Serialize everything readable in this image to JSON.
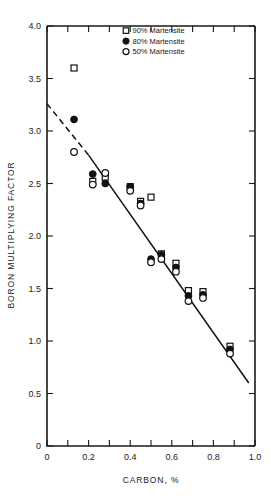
{
  "chart_data": {
    "type": "scatter",
    "title": "",
    "xlabel": "CARBON, %",
    "ylabel": "BORON MULTIPLYING FACTOR",
    "xlim": [
      0,
      1.0
    ],
    "ylim": [
      0,
      4.0
    ],
    "xticks": [
      0,
      0.1,
      0.2,
      0.3,
      0.4,
      0.5,
      0.6,
      0.7,
      0.8,
      0.9,
      1.0
    ],
    "xticklabels": [
      "0",
      "0.2",
      "0.4",
      "0.6",
      "0.8",
      "1.0"
    ],
    "xticklabel_values": [
      0,
      0.2,
      0.4,
      0.6,
      0.8,
      1.0
    ],
    "yticks": [
      0,
      0.5,
      1.0,
      1.5,
      2.0,
      2.5,
      3.0,
      3.5,
      4.0
    ],
    "yticklabels": [
      "0",
      "0.5",
      "1.0",
      "1.5",
      "2.0",
      "2.5",
      "3.0",
      "3.5",
      "4.0"
    ],
    "grid": false,
    "legend_position": "top-center",
    "series": [
      {
        "name": "90% Martensite",
        "marker": "open-square",
        "points": [
          [
            0.13,
            3.6
          ],
          [
            0.22,
            2.52
          ],
          [
            0.28,
            2.56
          ],
          [
            0.4,
            2.47
          ],
          [
            0.45,
            2.33
          ],
          [
            0.5,
            2.37
          ],
          [
            0.55,
            1.83
          ],
          [
            0.62,
            1.74
          ],
          [
            0.68,
            1.48
          ],
          [
            0.75,
            1.47
          ],
          [
            0.88,
            0.95
          ]
        ]
      },
      {
        "name": "80% Martensite",
        "marker": "filled-circle",
        "points": [
          [
            0.13,
            3.11
          ],
          [
            0.22,
            2.59
          ],
          [
            0.28,
            2.5
          ],
          [
            0.4,
            2.47
          ],
          [
            0.45,
            2.31
          ],
          [
            0.5,
            1.78
          ],
          [
            0.55,
            1.82
          ],
          [
            0.62,
            1.7
          ],
          [
            0.68,
            1.43
          ],
          [
            0.75,
            1.44
          ],
          [
            0.88,
            0.92
          ]
        ]
      },
      {
        "name": "50% Martensite",
        "marker": "open-circle",
        "points": [
          [
            0.13,
            2.8
          ],
          [
            0.22,
            2.49
          ],
          [
            0.28,
            2.6
          ],
          [
            0.4,
            2.43
          ],
          [
            0.45,
            2.29
          ],
          [
            0.5,
            1.75
          ],
          [
            0.55,
            1.78
          ],
          [
            0.62,
            1.66
          ],
          [
            0.68,
            1.38
          ],
          [
            0.75,
            1.41
          ],
          [
            0.88,
            0.88
          ]
        ]
      }
    ],
    "fit_line": {
      "label": "",
      "solid_segment": [
        [
          0.2,
          2.77
        ],
        [
          0.97,
          0.6
        ]
      ],
      "dashed_segment": [
        [
          0.0,
          3.26
        ],
        [
          0.2,
          2.77
        ]
      ]
    },
    "legend": [
      {
        "label": "90% Martensite",
        "marker": "open-square"
      },
      {
        "label": "80% Martensite",
        "marker": "filled-circle"
      },
      {
        "label": "50% Martensite",
        "marker": "open-circle"
      }
    ]
  }
}
